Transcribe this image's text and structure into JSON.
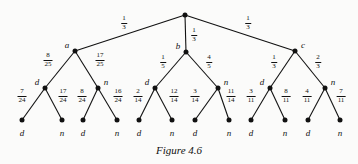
{
  "figure": {
    "caption": "Figure 4.6",
    "width": 358,
    "height": 164
  },
  "chart_data": {
    "type": "diagram",
    "subtype": "probability-tree",
    "title": "Figure 4.6",
    "root": {
      "label": "",
      "x": 185,
      "y": 15
    },
    "levels": 3,
    "nodes": {
      "root": {
        "id": "root",
        "label": "",
        "x": 185,
        "y": 15
      },
      "level1": [
        {
          "id": "a",
          "label": "a",
          "x": 75,
          "y": 51,
          "label_side": "left"
        },
        {
          "id": "b",
          "label": "b",
          "x": 186,
          "y": 52,
          "label_side": "left"
        },
        {
          "id": "c",
          "label": "c",
          "x": 295,
          "y": 51,
          "label_side": "right"
        }
      ],
      "level2": [
        {
          "id": "a-d",
          "label": "d",
          "x": 45,
          "y": 88,
          "label_side": "left"
        },
        {
          "id": "a-n",
          "label": "n",
          "x": 98,
          "y": 88,
          "label_side": "right"
        },
        {
          "id": "b-d",
          "label": "d",
          "x": 155,
          "y": 88,
          "label_side": "left"
        },
        {
          "id": "b-n",
          "label": "n",
          "x": 218,
          "y": 88,
          "label_side": "right"
        },
        {
          "id": "c-d",
          "label": "d",
          "x": 270,
          "y": 88,
          "label_side": "left"
        },
        {
          "id": "c-n",
          "label": "n",
          "x": 325,
          "y": 88,
          "label_side": "right"
        }
      ],
      "leaves": [
        {
          "id": "l1",
          "label": "d",
          "x": 22,
          "y": 120
        },
        {
          "id": "l2",
          "label": "n",
          "x": 62,
          "y": 120
        },
        {
          "id": "l3",
          "label": "d",
          "x": 83,
          "y": 120
        },
        {
          "id": "l4",
          "label": "n",
          "x": 117,
          "y": 120
        },
        {
          "id": "l5",
          "label": "d",
          "x": 139,
          "y": 120
        },
        {
          "id": "l6",
          "label": "n",
          "x": 172,
          "y": 120
        },
        {
          "id": "l7",
          "label": "d",
          "x": 195,
          "y": 120
        },
        {
          "id": "l8",
          "label": "n",
          "x": 229,
          "y": 120
        },
        {
          "id": "l9",
          "label": "d",
          "x": 251,
          "y": 120
        },
        {
          "id": "l10",
          "label": "n",
          "x": 285,
          "y": 120
        },
        {
          "id": "l11",
          "label": "d",
          "x": 308,
          "y": 120
        },
        {
          "id": "l12",
          "label": "n",
          "x": 340,
          "y": 120
        }
      ]
    },
    "edges": [
      {
        "from": "root",
        "to": "a",
        "num": "1",
        "den": "3",
        "label_x": 124,
        "label_y": 23
      },
      {
        "from": "root",
        "to": "b",
        "num": "1",
        "den": "3",
        "label_x": 194,
        "label_y": 35
      },
      {
        "from": "root",
        "to": "c",
        "num": "1",
        "den": "3",
        "label_x": 248,
        "label_y": 23
      },
      {
        "from": "a",
        "to": "a-d",
        "num": "8",
        "den": "25",
        "label_x": 48,
        "label_y": 60
      },
      {
        "from": "a",
        "to": "a-n",
        "num": "17",
        "den": "25",
        "label_x": 100,
        "label_y": 60
      },
      {
        "from": "b",
        "to": "b-d",
        "num": "1",
        "den": "5",
        "label_x": 163,
        "label_y": 62
      },
      {
        "from": "b",
        "to": "b-n",
        "num": "4",
        "den": "5",
        "label_x": 209,
        "label_y": 62
      },
      {
        "from": "c",
        "to": "c-d",
        "num": "1",
        "den": "3",
        "label_x": 274,
        "label_y": 62
      },
      {
        "from": "c",
        "to": "c-n",
        "num": "2",
        "den": "3",
        "label_x": 318,
        "label_y": 62
      },
      {
        "from": "a-d",
        "to": "l1",
        "num": "7",
        "den": "24",
        "label_x": 22,
        "label_y": 96
      },
      {
        "from": "a-d",
        "to": "l2",
        "num": "17",
        "den": "24",
        "label_x": 63,
        "label_y": 96
      },
      {
        "from": "a-n",
        "to": "l3",
        "num": "8",
        "den": "24",
        "label_x": 82,
        "label_y": 96
      },
      {
        "from": "a-n",
        "to": "l4",
        "num": "16",
        "den": "24",
        "label_x": 118,
        "label_y": 96
      },
      {
        "from": "b-d",
        "to": "l5",
        "num": "2",
        "den": "14",
        "label_x": 138,
        "label_y": 96
      },
      {
        "from": "b-d",
        "to": "l6",
        "num": "12",
        "den": "14",
        "label_x": 174,
        "label_y": 96
      },
      {
        "from": "b-n",
        "to": "l7",
        "num": "3",
        "den": "14",
        "label_x": 195,
        "label_y": 96
      },
      {
        "from": "b-n",
        "to": "l8",
        "num": "11",
        "den": "14",
        "label_x": 231,
        "label_y": 96
      },
      {
        "from": "c-d",
        "to": "l9",
        "num": "3",
        "den": "11",
        "label_x": 251,
        "label_y": 96
      },
      {
        "from": "c-d",
        "to": "l10",
        "num": "8",
        "den": "11",
        "label_x": 286,
        "label_y": 96
      },
      {
        "from": "c-n",
        "to": "l11",
        "num": "4",
        "den": "11",
        "label_x": 307,
        "label_y": 96
      },
      {
        "from": "c-n",
        "to": "l12",
        "num": "7",
        "den": "11",
        "label_x": 341,
        "label_y": 96
      }
    ]
  }
}
